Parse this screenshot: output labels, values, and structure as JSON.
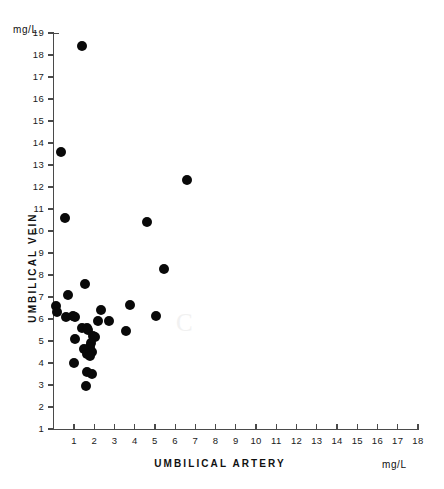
{
  "figure": {
    "unit_top": "mg/L",
    "unit_right": "mg/L",
    "x_title": "UMBILICAL ARTERY",
    "y_title": "UMBILICAL VEIN",
    "artifact_glyph": "C",
    "ink_color": "#090909",
    "axis_color": "#4a4a4a"
  },
  "chart_data": {
    "type": "scatter",
    "title": "",
    "xlabel": "UMBILICAL ARTERY",
    "ylabel": "UMBILICAL VEIN",
    "xunit": "mg/L",
    "yunit": "mg/L",
    "xlim": [
      0,
      18.2
    ],
    "ylim": [
      0.4,
      19.0
    ],
    "grid": false,
    "legend": null,
    "xticks": [
      1,
      2,
      3,
      4,
      5,
      6,
      7,
      8,
      9,
      10,
      11,
      12,
      13,
      14,
      15,
      16,
      17,
      18
    ],
    "xticklabels": [
      "1",
      "2",
      "3",
      "4",
      "5",
      "6",
      "7",
      "8",
      "9",
      "10",
      "11",
      "12",
      "13",
      "14",
      "15",
      "16",
      "17",
      "18"
    ],
    "yticks": [
      1,
      2,
      3,
      4,
      5,
      6,
      7,
      8,
      9,
      10,
      11,
      12,
      13,
      14,
      15,
      16,
      17,
      18,
      19
    ],
    "yticklabels": [
      "1",
      "2",
      "3",
      "4",
      "5",
      "6",
      "7",
      "8",
      "9",
      "10",
      "11",
      "12",
      "13",
      "14",
      "15",
      "16",
      "17",
      "18",
      "19"
    ],
    "points": [
      {
        "x": 1.4,
        "y": 18.4
      },
      {
        "x": 0.35,
        "y": 13.6
      },
      {
        "x": 6.6,
        "y": 12.3
      },
      {
        "x": 0.55,
        "y": 10.6
      },
      {
        "x": 4.6,
        "y": 10.4
      },
      {
        "x": 5.45,
        "y": 8.28
      },
      {
        "x": 1.55,
        "y": 7.58
      },
      {
        "x": 0.7,
        "y": 7.08
      },
      {
        "x": 3.75,
        "y": 6.62
      },
      {
        "x": 0.12,
        "y": 6.58
      },
      {
        "x": 2.35,
        "y": 6.42
      },
      {
        "x": 0.18,
        "y": 6.34
      },
      {
        "x": 5.05,
        "y": 6.12
      },
      {
        "x": 0.62,
        "y": 6.1
      },
      {
        "x": 0.95,
        "y": 6.14
      },
      {
        "x": 1.05,
        "y": 6.08
      },
      {
        "x": 2.75,
        "y": 5.92
      },
      {
        "x": 2.2,
        "y": 5.9
      },
      {
        "x": 1.4,
        "y": 5.58
      },
      {
        "x": 1.65,
        "y": 5.58
      },
      {
        "x": 1.7,
        "y": 5.52
      },
      {
        "x": 3.55,
        "y": 5.46
      },
      {
        "x": 1.95,
        "y": 5.22
      },
      {
        "x": 2.05,
        "y": 5.2
      },
      {
        "x": 1.05,
        "y": 5.08
      },
      {
        "x": 1.82,
        "y": 4.92
      },
      {
        "x": 1.78,
        "y": 4.72
      },
      {
        "x": 1.5,
        "y": 4.62
      },
      {
        "x": 1.88,
        "y": 4.52
      },
      {
        "x": 1.62,
        "y": 4.4
      },
      {
        "x": 1.8,
        "y": 4.3
      },
      {
        "x": 1.0,
        "y": 4.02
      },
      {
        "x": 1.62,
        "y": 3.58
      },
      {
        "x": 1.88,
        "y": 3.52
      },
      {
        "x": 1.6,
        "y": 2.95
      }
    ]
  }
}
